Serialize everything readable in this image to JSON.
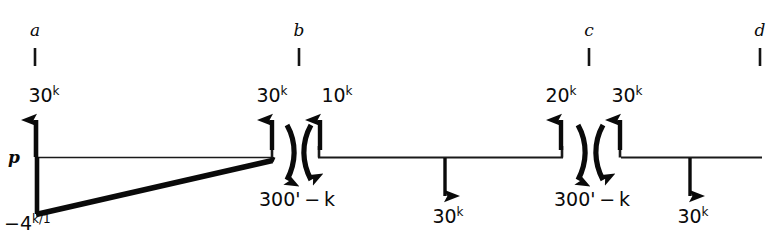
{
  "diagram": {
    "type": "structural-free-body-diagram",
    "ink_color": "#0a0a0a",
    "background": "#ffffff",
    "baseline_label": "p",
    "stations": [
      {
        "name": "station-a",
        "label": "a",
        "x": 35
      },
      {
        "name": "station-b",
        "label": "b",
        "x": 299
      },
      {
        "name": "station-c",
        "label": "c",
        "x": 589
      },
      {
        "name": "station-d",
        "label": "d",
        "x": 760
      }
    ],
    "forces": [
      {
        "name": "force-a-up",
        "value": "30",
        "exp": "k",
        "x": 36,
        "dir": "up"
      },
      {
        "name": "force-b-left-up",
        "value": "30",
        "exp": "k",
        "x": 272,
        "dir": "up"
      },
      {
        "name": "force-b-right-up",
        "value": "10",
        "exp": "k",
        "x": 322,
        "dir": "up"
      },
      {
        "name": "force-mid-down",
        "value": "30",
        "exp": "k",
        "x": 445,
        "dir": "down"
      },
      {
        "name": "force-c-left-up",
        "value": "20",
        "exp": "k",
        "x": 561,
        "dir": "up"
      },
      {
        "name": "force-c-right-up",
        "value": "30",
        "exp": "k",
        "x": 620,
        "dir": "up"
      },
      {
        "name": "force-right-down",
        "value": "30",
        "exp": "k",
        "x": 690,
        "dir": "down"
      }
    ],
    "moments": [
      {
        "name": "moment-b",
        "label": "300' − k",
        "x": 297
      },
      {
        "name": "moment-c",
        "label": "300' − k",
        "x": 592
      }
    ],
    "distributed_load": {
      "name": "triangular-distributed-load",
      "peak_label": "−4",
      "peak_exp": "k/1",
      "from_x": 36,
      "to_x": 272,
      "peak_value_y": 218
    },
    "force_labels": {
      "a_up": "30",
      "b_left_up": "30",
      "b_right_up": "10",
      "mid_down": "30",
      "c_left_up": "20",
      "c_right_up": "30",
      "right_down": "30",
      "exp": "k"
    }
  }
}
